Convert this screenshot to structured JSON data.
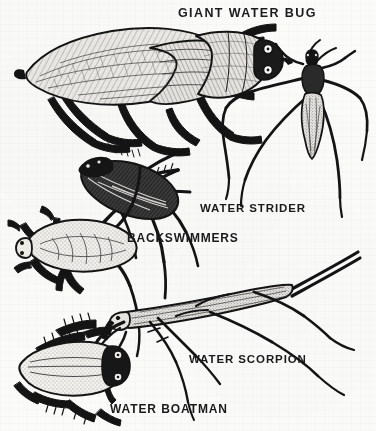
{
  "plate": {
    "title": "Aquatic True Bugs Identification Plate",
    "medium": "pen-and-ink scientific illustration",
    "background_color": "#fbfbfa",
    "ink_color": "#141414",
    "width": 376,
    "height": 431
  },
  "captions": {
    "giant_water_bug": "GIANT WATER BUG",
    "water_strider": "WATER STRIDER",
    "backswimmers": "BACKSWIMMERS",
    "water_scorpion": "WATER SCORPION",
    "water_boatman": "WATER BOATMAN"
  },
  "specimens": [
    {
      "id": "giant-water-bug",
      "label": "GIANT WATER BUG",
      "count": 1,
      "orientation": "dorsal view, head to the right, body tilted",
      "notes": "large broad oval body with veined forewings, raptorial front legs, flattened swimming legs"
    },
    {
      "id": "water-strider",
      "label": "WATER STRIDER",
      "count": 1,
      "orientation": "dorsal view, head upward",
      "notes": "slender narrow body, very long splayed middle and hind legs, short front legs, antennae"
    },
    {
      "id": "backswimmers",
      "label": "BACKSWIMMERS",
      "count": 2,
      "orientation": "one upper dark specimen angled, one lower pale specimen head to the left",
      "notes": "boat-shaped bodies with long oar-like fringed hind legs"
    },
    {
      "id": "water-scorpion",
      "label": "WATER SCORPION",
      "count": 1,
      "orientation": "lateral view, head to the left, abdomen and breathing tube to upper right",
      "notes": "stick-like elongated body, long caudal breathing siphon, raptorial forelegs, long thin walking legs"
    },
    {
      "id": "water-boatman",
      "label": "WATER BOATMAN",
      "count": 1,
      "orientation": "dorsal view, head to the right",
      "notes": "stippled oval body, large dark compound eyes, fringed hind swimming legs"
    }
  ]
}
